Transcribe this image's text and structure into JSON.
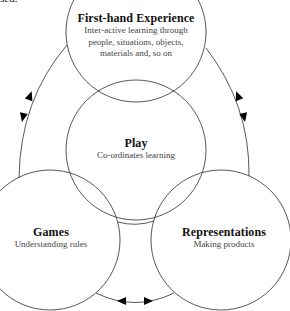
{
  "page": {
    "clipped_text": "sed."
  },
  "nodes": {
    "first_hand": {
      "title": "First-hand Experience",
      "lines": [
        "Inter-active learning through",
        "people, situations, objects,",
        "materials and, so on"
      ]
    },
    "play": {
      "title": "Play",
      "lines": [
        "Co-ordinates learning"
      ]
    },
    "games": {
      "title": "Games",
      "lines": [
        "Understanding rules"
      ]
    },
    "representations": {
      "title": "Representations",
      "lines": [
        "Making products"
      ]
    }
  },
  "connectors": [
    {
      "from": "first_hand",
      "to": "games",
      "type": "bidirectional-arrow"
    },
    {
      "from": "first_hand",
      "to": "representations",
      "type": "bidirectional-arrow"
    },
    {
      "from": "games",
      "to": "representations",
      "type": "bidirectional-arrow"
    }
  ],
  "style": {
    "stroke": "#444444",
    "arrow_fill": "#000000",
    "background": "#ffffff"
  }
}
